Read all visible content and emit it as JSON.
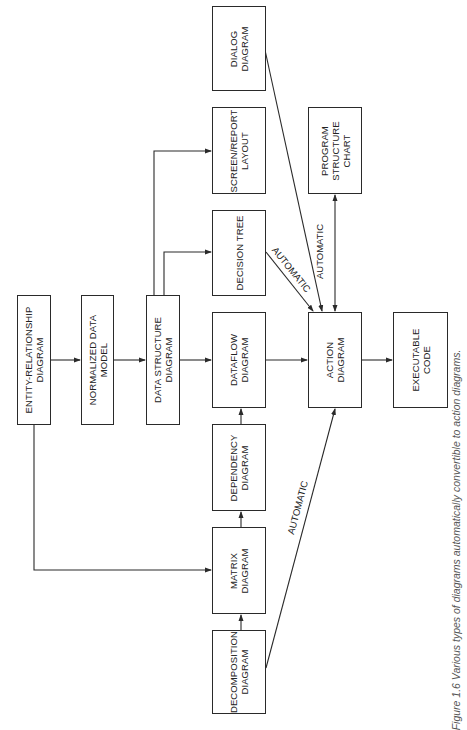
{
  "diagram": {
    "orientation": "rotated-90-ccw",
    "nodes": [
      {
        "id": "er",
        "label": "ENTITY-RELATIONSHIP\nDIAGRAM",
        "x": 17,
        "y": 295,
        "w": 34,
        "h": 130
      },
      {
        "id": "norm",
        "label": "NORMALIZED DATA\nMODEL",
        "x": 81,
        "y": 295,
        "w": 33,
        "h": 130
      },
      {
        "id": "ds",
        "label": "DATA STRUCTURE\nDIAGRAM",
        "x": 146,
        "y": 295,
        "w": 34,
        "h": 130
      },
      {
        "id": "dialog",
        "label": "DIALOG\nDIAGRAM",
        "x": 212,
        "y": 6,
        "w": 54,
        "h": 85
      },
      {
        "id": "screen",
        "label": "SCREEN/REPORT\nLAYOUT",
        "x": 212,
        "y": 107,
        "w": 54,
        "h": 87
      },
      {
        "id": "dtree",
        "label": "DECISION TREE",
        "x": 212,
        "y": 210,
        "w": 54,
        "h": 86
      },
      {
        "id": "dataflow",
        "label": "DATAFLOW\nDIAGRAM",
        "x": 212,
        "y": 312,
        "w": 54,
        "h": 96
      },
      {
        "id": "dependency",
        "label": "DEPENDENCY\nDIAGRAM",
        "x": 212,
        "y": 424,
        "w": 54,
        "h": 87
      },
      {
        "id": "matrix",
        "label": "MATRIX\nDIAGRAM",
        "x": 212,
        "y": 527,
        "w": 54,
        "h": 87
      },
      {
        "id": "decomp",
        "label": "DECOMPOSITION\nDIAGRAM",
        "x": 212,
        "y": 630,
        "w": 54,
        "h": 84
      },
      {
        "id": "psc",
        "label": "PROGRAM\nSTRUCTURE\nCHART",
        "x": 308,
        "y": 107,
        "w": 54,
        "h": 87
      },
      {
        "id": "action",
        "label": "ACTION\nDIAGRAM",
        "x": 308,
        "y": 312,
        "w": 54,
        "h": 96
      },
      {
        "id": "exec",
        "label": "EXECUTABLE\nCODE",
        "x": 393,
        "y": 312,
        "w": 55,
        "h": 96
      }
    ],
    "edges": [
      {
        "from": "er",
        "to": "norm"
      },
      {
        "from": "norm",
        "to": "ds"
      },
      {
        "from": "ds",
        "to": "dataflow"
      },
      {
        "from": "ds",
        "to": "dtree"
      },
      {
        "from": "ds",
        "to": "screen"
      },
      {
        "from": "er",
        "to": "matrix"
      },
      {
        "from": "decomp",
        "to": "matrix"
      },
      {
        "from": "matrix",
        "to": "dependency"
      },
      {
        "from": "dependency",
        "to": "dataflow"
      },
      {
        "from": "dataflow",
        "to": "action"
      },
      {
        "from": "dtree",
        "to": "action",
        "label": "AUTOMATIC"
      },
      {
        "from": "dialog",
        "to": "action"
      },
      {
        "from": "psc",
        "to": "action",
        "label": "AUTOMATIC",
        "bidirectional": true
      },
      {
        "from": "decomp",
        "to": "action",
        "label": "AUTOMATIC"
      },
      {
        "from": "action",
        "to": "exec"
      }
    ],
    "edge_labels": {
      "dtree_action": "AUTOMATIC",
      "psc_action": "AUTOMATIC",
      "decomp_action": "AUTOMATIC"
    },
    "caption": "Figure 1.6 Various types of diagrams automatically convertible to action diagrams.",
    "colors": {
      "line": "#2a2a2a",
      "background": "#ffffff",
      "text": "#222222"
    }
  }
}
